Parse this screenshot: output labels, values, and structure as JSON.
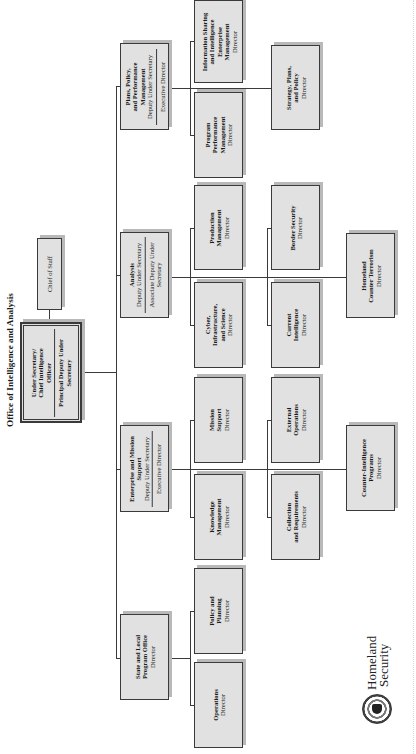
{
  "title": "Office of Intelligence and Analysis",
  "top": {
    "line1": "Under Secretary/",
    "line2": "Chief Intelligence",
    "line3": "Officer",
    "deputy1": "Principal Deputy Under",
    "deputy2": "Secretary"
  },
  "chief_of_staff": "Chief of Staff",
  "divisions": {
    "plans": {
      "name1": "Plans, Policy,",
      "name2": "and Performance",
      "name3": "Management",
      "role1": "Deputy Under Secretary",
      "role2": "Executive Director",
      "children": {
        "info_sharing": {
          "n1": "Information Sharing",
          "n2": "and Intelligence",
          "n3": "Enterprise",
          "n4": "Management",
          "role": "Director"
        },
        "program_perf": {
          "n1": "Program",
          "n2": "Performance",
          "n3": "Management",
          "role": "Director"
        },
        "strategy": {
          "n1": "Strategy, Plans,",
          "n2": "and Policy",
          "role": "Director"
        }
      }
    },
    "analysis": {
      "name1": "Analysis",
      "role1": "Deputy Under Secretary",
      "role2a": "Associate Deputy Under",
      "role2b": "Secretary",
      "children": {
        "production": {
          "n1": "Production",
          "n2": "Management",
          "role": "Director"
        },
        "cyber": {
          "n1": "Cyber,",
          "n2": "Infrastructure,",
          "n3": "and Science",
          "role": "Director"
        },
        "border": {
          "n1": "Border Security",
          "role": "Director"
        },
        "current": {
          "n1": "Current",
          "n2": "Intelligence",
          "role": "Director"
        },
        "homeland_ct": {
          "n1": "Homeland",
          "n2": "Counter Terrorism",
          "role": "Director"
        }
      }
    },
    "enterprise": {
      "name1": "Enterprise and Mission",
      "name2": "Support",
      "role1": "Deputy Under Secretary",
      "role2": "Executive Director",
      "children": {
        "mission_support": {
          "n1": "Mission",
          "n2": "Support",
          "role": "Director"
        },
        "knowledge": {
          "n1": "Knowledge",
          "n2": "Management",
          "role": "Director"
        },
        "external_ops": {
          "n1": "External",
          "n2": "Operations",
          "role": "Director"
        },
        "collection": {
          "n1": "Collection",
          "n2": "and Requirements",
          "role": "Director"
        },
        "counter_intel": {
          "n1": "Counter-Intelligence",
          "n2": "Programs",
          "role": "Director"
        }
      }
    },
    "state_local": {
      "name1": "State and Local",
      "name2": "Program Office",
      "role1": "Director",
      "children": {
        "policy_planning": {
          "n1": "Policy and",
          "n2": "Planning",
          "role": "Director"
        },
        "operations": {
          "n1": "Operations",
          "role": "Director"
        }
      }
    }
  },
  "logo": {
    "line1": "Homeland",
    "line2": "Security",
    "seal": "dhs-seal-icon"
  }
}
